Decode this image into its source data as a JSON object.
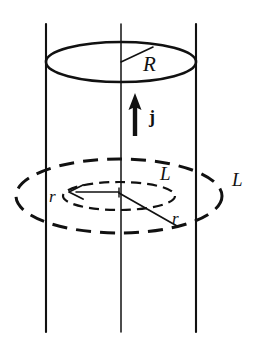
{
  "figure": {
    "stroke_color": "#111111",
    "background_color": "#ffffff",
    "labels": {
      "outer_radius": "R",
      "current_density": "j",
      "loop_outer": "L",
      "loop_inner": "L",
      "radius_inner_left": "r",
      "radius_inner_right": "r"
    },
    "elements": {
      "cylinder_left_edge": "vertical-line",
      "cylinder_axis": "vertical-line",
      "cylinder_right_edge": "vertical-line",
      "top_rim": "solid-ellipse",
      "radius_leader": "solid-line",
      "current_arrow": "up-arrow",
      "outer_loop": "dashed-ellipse",
      "inner_loop": "dashed-ellipse",
      "inner_radius_arrow": "left-arrow",
      "inner_radius_leader": "solid-line"
    }
  },
  "geometry": {
    "cylinder": {
      "left_x": 46,
      "axis_x": 121,
      "right_x": 196,
      "top_y": 24,
      "bottom_y": 332
    },
    "top_ellipse": {
      "cx": 121,
      "cy": 62,
      "rx": 75,
      "ry": 20
    },
    "outer_loop": {
      "cx": 119,
      "cy": 196,
      "rx": 103,
      "ry": 37
    },
    "inner_loop": {
      "cx": 119,
      "cy": 196,
      "rx": 56,
      "ry": 14
    },
    "current_arrow": {
      "x": 135,
      "y_tail": 136,
      "y_head": 94
    },
    "radius_leader": {
      "x1": 121,
      "y1": 62,
      "x2": 153,
      "y2": 47
    },
    "inner_radius_leader": {
      "x1": 119,
      "y1": 196,
      "x2": 176,
      "y2": 225
    },
    "inner_radius_arrow": {
      "x_tail": 119,
      "x_head": 71,
      "y": 192
    }
  },
  "label_positions": {
    "R": {
      "left": 143,
      "top": 54
    },
    "j": {
      "left": 149,
      "top": 108
    },
    "L_inner": {
      "left": 160,
      "top": 164
    },
    "L_outer": {
      "left": 232,
      "top": 170
    },
    "r_left": {
      "left": 49,
      "top": 188
    },
    "r_right": {
      "left": 172,
      "top": 210
    }
  }
}
